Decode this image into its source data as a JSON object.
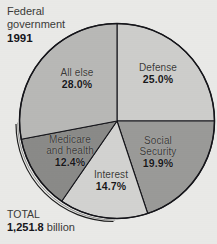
{
  "background_color": "#e9e9e7",
  "title": {
    "line1": "Federal",
    "line2": "government",
    "year": "1991"
  },
  "total": {
    "label": "TOTAL",
    "value": "1,251.8",
    "unit": " billion"
  },
  "chart_data": {
    "type": "pie",
    "title": "Federal government 1991",
    "total_label": "TOTAL",
    "total_value": "1,251.8 billion",
    "units": "billion dollars",
    "start_angle_deg": 0,
    "direction": "clockwise",
    "grid": false,
    "legend": "none (labels inside slices)",
    "categories": [
      "Defense",
      "Social Security",
      "Interest",
      "Medicare and health",
      "All else"
    ],
    "values": [
      25.0,
      19.9,
      14.7,
      12.4,
      28.0
    ],
    "value_labels": [
      "25.0%",
      "19.9%",
      "14.7%",
      "12.4%",
      "28.0%"
    ],
    "colors": [
      "#cdcdcb",
      "#9a9a98",
      "#d2d2d0",
      "#8a8a88",
      "#b8b8b6"
    ],
    "slices": [
      {
        "name": "Defense",
        "name_line1": "Defense",
        "name_line2": "",
        "pct": 25.0,
        "pct_label": "25.0%",
        "color": "#cdcdcb"
      },
      {
        "name": "Social Security",
        "name_line1": "Social",
        "name_line2": "Security",
        "pct": 19.9,
        "pct_label": "19.9%",
        "color": "#9a9a98"
      },
      {
        "name": "Interest",
        "name_line1": "Interest",
        "name_line2": "",
        "pct": 14.7,
        "pct_label": "14.7%",
        "color": "#d2d2d0"
      },
      {
        "name": "Medicare and health",
        "name_line1": "Medicare",
        "name_line2": "and health",
        "pct": 12.4,
        "pct_label": "12.4%",
        "color": "#8a8a88"
      },
      {
        "name": "All else",
        "name_line1": "All else",
        "name_line2": "",
        "pct": 28.0,
        "pct_label": "28.0%",
        "color": "#b8b8b6"
      }
    ]
  }
}
